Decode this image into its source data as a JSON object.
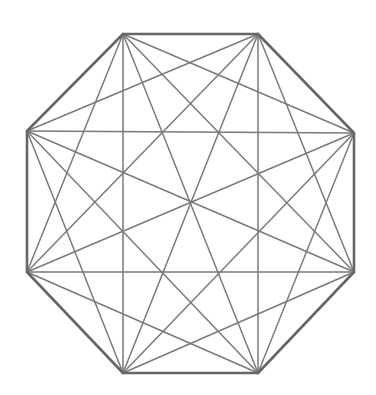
{
  "diagram": {
    "type": "complete-graph",
    "vertex_count": 8,
    "vertices": [
      {
        "id": "A",
        "x": 123,
        "y": 34
      },
      {
        "id": "B",
        "x": 258,
        "y": 34
      },
      {
        "id": "C",
        "x": 354,
        "y": 133
      },
      {
        "id": "D",
        "x": 354,
        "y": 272
      },
      {
        "id": "E",
        "x": 258,
        "y": 373
      },
      {
        "id": "F",
        "x": 123,
        "y": 373
      },
      {
        "id": "G",
        "x": 27,
        "y": 272
      },
      {
        "id": "H",
        "x": 27,
        "y": 131
      }
    ],
    "colors": {
      "background": "#ffffff",
      "outline": "#666666",
      "diagonal": "#7a7a7a"
    },
    "stroke": {
      "outline_width": 2.6,
      "diagonal_width": 1.5
    }
  }
}
